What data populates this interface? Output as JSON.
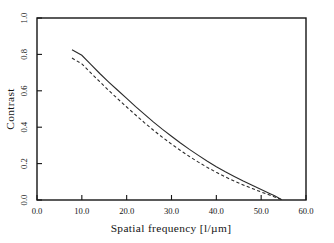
{
  "chart_data": {
    "type": "line",
    "title": "",
    "subtitle": "",
    "xlabel": "Spatial frequency  [l/µm]",
    "ylabel": "Contrast",
    "xlim": [
      0.0,
      60.0
    ],
    "ylim": [
      0.0,
      1.0
    ],
    "xticks": [
      "0.0",
      "10.0",
      "20.0",
      "30.0",
      "40.0",
      "50.0",
      "60.0"
    ],
    "xtick_values": [
      0.0,
      10.0,
      20.0,
      30.0,
      40.0,
      50.0,
      60.0
    ],
    "yticks": [
      "0.0",
      "0.2",
      "0.4",
      "0.6",
      "0.8",
      "1.0"
    ],
    "ytick_values": [
      0.0,
      0.2,
      0.4,
      0.6,
      0.8,
      1.0
    ],
    "grid": false,
    "legend": "none",
    "series": [
      {
        "name": "solid curve",
        "style": "solid",
        "color": "#2b2b2b",
        "x": [
          7.8,
          10.0,
          12.0,
          14.0,
          16.0,
          18.0,
          20.0,
          22.0,
          24.0,
          26.0,
          28.0,
          30.0,
          32.0,
          34.0,
          36.0,
          38.0,
          40.0,
          42.0,
          44.0,
          46.0,
          48.0,
          50.0,
          52.0,
          53.0,
          54.0,
          54.6
        ],
        "y": [
          0.825,
          0.795,
          0.745,
          0.695,
          0.648,
          0.603,
          0.558,
          0.513,
          0.47,
          0.428,
          0.388,
          0.35,
          0.313,
          0.278,
          0.245,
          0.213,
          0.183,
          0.155,
          0.129,
          0.104,
          0.081,
          0.058,
          0.035,
          0.023,
          0.01,
          0.002
        ]
      },
      {
        "name": "dashed curve",
        "style": "dashed",
        "color": "#2b2b2b",
        "x": [
          7.8,
          10.0,
          12.0,
          14.0,
          16.0,
          18.0,
          20.0,
          22.0,
          24.0,
          26.0,
          28.0,
          30.0,
          32.0,
          34.0,
          36.0,
          38.0,
          40.0,
          42.0,
          44.0,
          46.0,
          48.0,
          50.0,
          52.0,
          53.0,
          54.0,
          54.6
        ],
        "y": [
          0.78,
          0.748,
          0.698,
          0.65,
          0.602,
          0.556,
          0.511,
          0.467,
          0.424,
          0.383,
          0.344,
          0.307,
          0.272,
          0.239,
          0.208,
          0.179,
          0.152,
          0.127,
          0.104,
          0.083,
          0.063,
          0.044,
          0.026,
          0.017,
          0.007,
          0.001
        ]
      }
    ]
  }
}
